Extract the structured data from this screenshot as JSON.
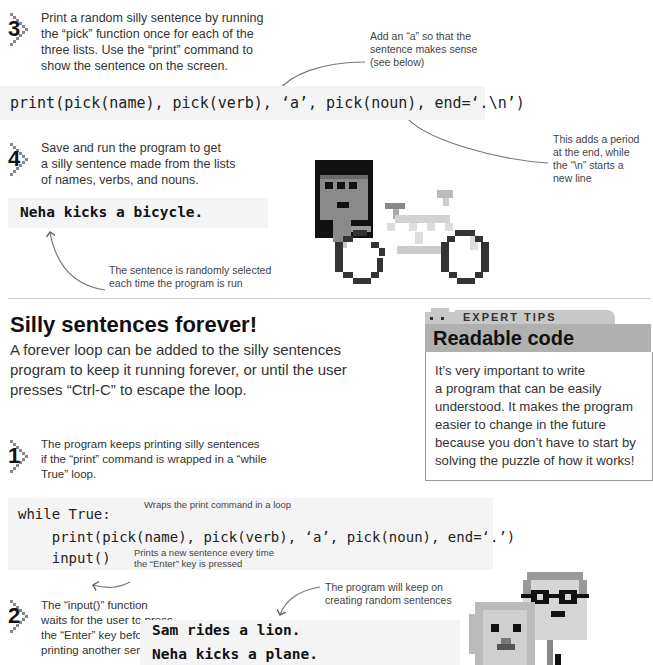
{
  "step3": {
    "number": "3",
    "text_lines": [
      "Print a random silly sentence by running",
      "the “pick” function once for each of the",
      "three lists. Use the “print” command to",
      "show the sentence on the screen."
    ],
    "annotation_lines": [
      "Add an “a” so that the",
      "sentence makes sense",
      "(see below)"
    ],
    "code": "print(pick(name), pick(verb), ‘a’, pick(noun), end=‘.\\n’)",
    "annotation2_lines": [
      "This adds a period",
      "at the end, while",
      "the “\\n” starts a",
      "new line"
    ]
  },
  "step4": {
    "number": "4",
    "text_lines": [
      "Save and run the program to get",
      "a silly sentence made from the lists",
      "of names, verbs, and nouns."
    ],
    "output": "Neha kicks a bicycle.",
    "annotation_lines": [
      "The sentence is randomly selected",
      "each time the program is run"
    ]
  },
  "section": {
    "title": "Silly sentences forever!",
    "intro_lines": [
      "A forever loop can be added to the silly sentences",
      "program to keep it running forever, or until the user",
      "presses “Ctrl-C” to escape the loop."
    ]
  },
  "tip": {
    "label": "EXPERT TIPS",
    "title": "Readable code",
    "body_lines": [
      "It’s very important to write",
      "a program that can be easily",
      "understood. It makes the program",
      "easier to change in the future",
      "because you don’t have to start by",
      "solving the puzzle of how it works!"
    ]
  },
  "step1": {
    "number": "1",
    "text_lines": [
      "The program keeps printing silly sentences",
      "if the “print” command is wrapped in a “while",
      "True” loop."
    ],
    "code_lines": [
      "while True:",
      "    print(pick(name), pick(verb), ‘a’, pick(noun), end=‘.’)",
      "    input()"
    ],
    "annotation_while": "Wraps the print command in a loop",
    "annotation_input_lines": [
      "Prints a new sentence every time",
      "the “Enter” key is pressed"
    ]
  },
  "step2": {
    "number": "2",
    "text_lines": [
      "The “input()” function",
      "waits for the user to press",
      "the “Enter” key before",
      "printing another sentence."
    ],
    "annotation_lines": [
      "The program will keep on",
      "creating random sentences"
    ],
    "output_lines": [
      "Sam rides a lion.",
      "Neha kicks a plane."
    ]
  },
  "colors": {
    "code_background": "#f4f4f4",
    "tip_header": "#b0b0b0",
    "tip_tab": "#c8c8c8",
    "text": "#333333"
  }
}
